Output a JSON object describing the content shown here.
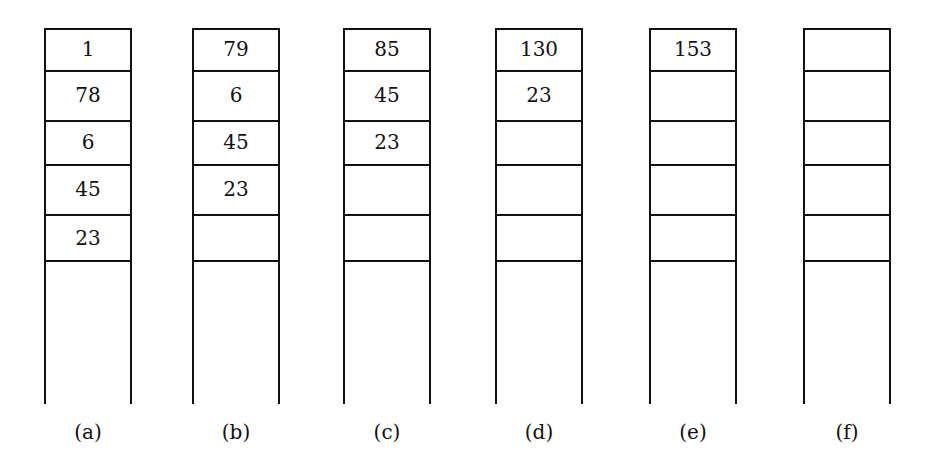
{
  "stacks": [
    {
      "label": "(a)",
      "cells": [
        "1",
        "78",
        "6",
        "45",
        "23"
      ]
    },
    {
      "label": "(b)",
      "cells": [
        "79",
        "6",
        "45",
        "23",
        ""
      ]
    },
    {
      "label": "(c)",
      "cells": [
        "85",
        "45",
        "23",
        "",
        ""
      ]
    },
    {
      "label": "(d)",
      "cells": [
        "130",
        "23",
        "",
        "",
        ""
      ]
    },
    {
      "label": "(e)",
      "cells": [
        "153",
        "",
        "",
        "",
        ""
      ]
    },
    {
      "label": "(f)",
      "cells": [
        "",
        "",
        "",
        "",
        ""
      ]
    }
  ],
  "colors": {
    "line": "#111111",
    "background": "#ffffff"
  }
}
